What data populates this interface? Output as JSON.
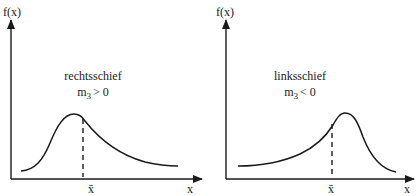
{
  "left_panel": {
    "y_axis_label": "f(x)",
    "x_axis_label": "x",
    "mean_label": "x̄",
    "title": "rechtsschief",
    "moment_symbol": "m",
    "moment_subscript": "3",
    "moment_condition": "> 0"
  },
  "right_panel": {
    "y_axis_label": "f(x)",
    "x_axis_label": "x",
    "mean_label": "x̄",
    "title": "linksschief",
    "moment_symbol": "m",
    "moment_subscript": "3",
    "moment_condition": "< 0"
  },
  "colors": {
    "ink": "#1a1a1a",
    "background": "#ffffff"
  }
}
